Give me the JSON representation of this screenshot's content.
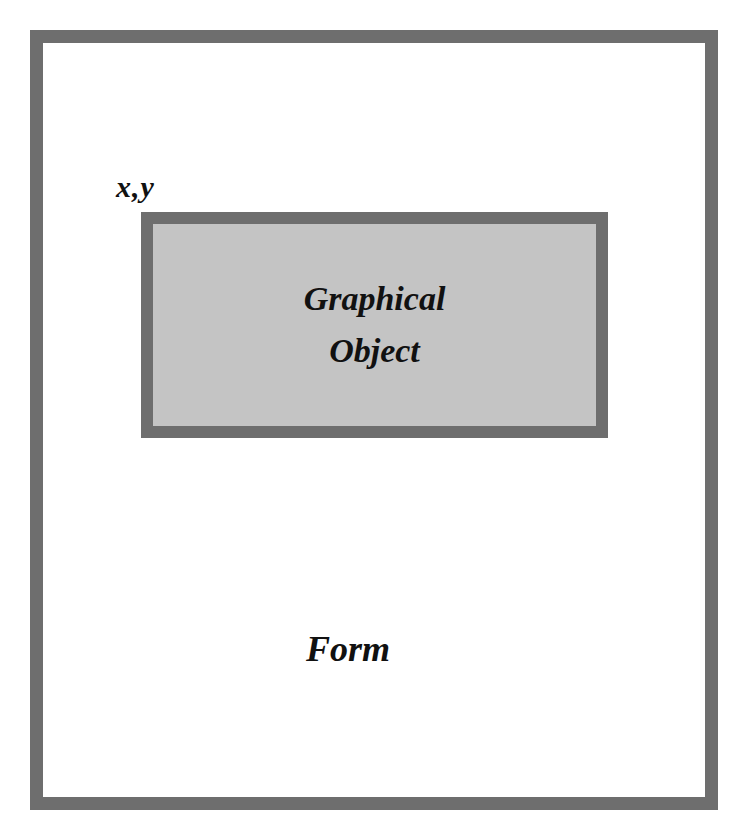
{
  "diagram": {
    "form": {
      "label": "Form",
      "border_color": "#6e6e6e",
      "fill_color": "#ffffff"
    },
    "origin_label": "x,y",
    "graphical_object": {
      "lines": [
        "Graphical",
        "Object"
      ],
      "border_color": "#6e6e6e",
      "fill_color": "#c4c4c4"
    }
  }
}
